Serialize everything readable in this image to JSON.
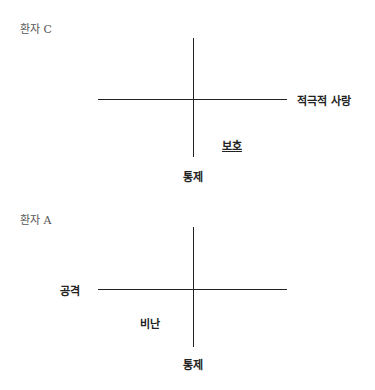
{
  "diagrams": [
    {
      "title": "환자 C",
      "labels": {
        "right": "적극적 사랑",
        "bottom": "통제",
        "quadrant": "보호"
      }
    },
    {
      "title": "환자 A",
      "labels": {
        "left": "공격",
        "bottom": "통제",
        "quadrant": "비난"
      }
    }
  ]
}
